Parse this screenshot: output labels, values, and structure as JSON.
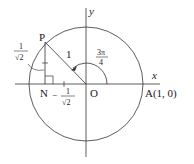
{
  "diagram": {
    "type": "unit-circle",
    "axes": {
      "x_label": "x",
      "y_label": "y"
    },
    "points": {
      "origin": "O",
      "point_a": "A(1, 0)",
      "point_p": "P",
      "point_n": "N"
    },
    "labels": {
      "hypotenuse": "1",
      "angle_num": "3π",
      "angle_den": "4",
      "pn_num": "1",
      "pn_den": "√2",
      "on_sign": "−",
      "on_num": "1",
      "on_den": "√2"
    },
    "colors": {
      "stroke": "#333333",
      "text": "#1a1a1a"
    }
  }
}
